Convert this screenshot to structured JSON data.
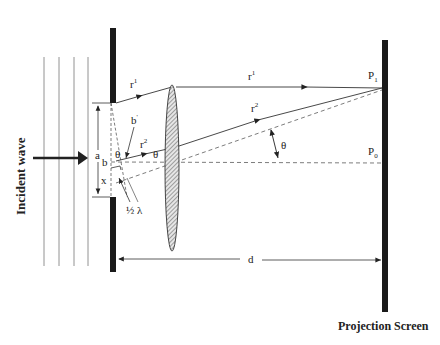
{
  "diagram": {
    "labels": {
      "incident_wave": "Incident wave",
      "projection_screen": "Projection Screen",
      "ray1": "r",
      "ray1_sup": "1",
      "ray1_far": "r",
      "ray1_far_sup": "1",
      "ray2": "r",
      "ray2_sup": "2",
      "ray2_far": "r",
      "ray2_far_sup": "2",
      "slit_width": "a",
      "point_b": "b",
      "point_b_prime": "b",
      "point_b_prime_sup": "'",
      "point_x": "x",
      "theta_slit": "θ",
      "theta_ray": "θ",
      "theta_screen": "θ",
      "half_lambda": "½ λ",
      "distance": "d",
      "p1": "P",
      "p1_sub": "1",
      "p0": "P",
      "p0_sub": "0"
    },
    "colors": {
      "line": "#333333",
      "barrier": "#1a1a1a",
      "lens_fill": "#cccccc"
    }
  }
}
